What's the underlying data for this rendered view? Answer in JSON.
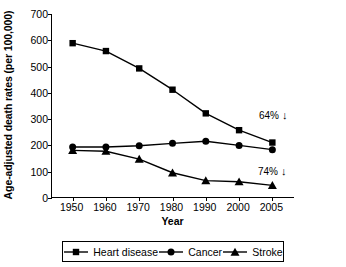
{
  "chart_data": {
    "type": "line",
    "title": "",
    "xlabel": "Year",
    "ylabel": "Age-adjusted death rates (per 100,000)",
    "x": [
      1950,
      1960,
      1970,
      1980,
      1990,
      2000,
      2005
    ],
    "xtick_labels": [
      "1950",
      "1960",
      "1970",
      "1980",
      "1990",
      "2000",
      "2005"
    ],
    "ytick_labels": [
      "0",
      "100",
      "200",
      "300",
      "400",
      "500",
      "600",
      "700"
    ],
    "ytick_values": [
      0,
      100,
      200,
      300,
      400,
      500,
      600,
      700
    ],
    "ylim": [
      0,
      700
    ],
    "grid": false,
    "legend_position": "bottom",
    "series": [
      {
        "name": "Heart disease",
        "marker": "square",
        "color": "#000000",
        "values": [
          589,
          559,
          493,
          412,
          322,
          258,
          211
        ]
      },
      {
        "name": "Cancer",
        "marker": "circle",
        "color": "#000000",
        "values": [
          194,
          194,
          199,
          208,
          216,
          200,
          184
        ]
      },
      {
        "name": "Stroke",
        "marker": "triangle",
        "color": "#000000",
        "values": [
          181,
          178,
          148,
          96,
          66,
          62,
          48
        ]
      }
    ],
    "annotations": [
      {
        "text": "64%",
        "arrow": "↓",
        "series": "Heart disease"
      },
      {
        "text": "74%",
        "arrow": "↓",
        "series": "Stroke"
      }
    ]
  },
  "legend": {
    "entries": [
      {
        "label": "Heart disease",
        "marker": "square-marker-icon"
      },
      {
        "label": "Cancer",
        "marker": "circle-marker-icon"
      },
      {
        "label": "Stroke",
        "marker": "triangle-marker-icon"
      }
    ]
  }
}
